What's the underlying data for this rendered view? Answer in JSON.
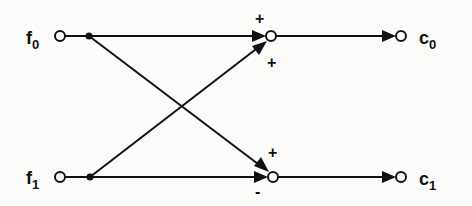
{
  "diagram": {
    "type": "butterfly signal-flow graph",
    "inputs": [
      {
        "id": "f0",
        "label": "f",
        "subscript": "0"
      },
      {
        "id": "f1",
        "label": "f",
        "subscript": "1"
      }
    ],
    "outputs": [
      {
        "id": "c0",
        "label": "c",
        "subscript": "0"
      },
      {
        "id": "c1",
        "label": "c",
        "subscript": "1"
      }
    ],
    "summing_nodes": [
      {
        "id": "sum0",
        "output": "c0",
        "signs": {
          "from_f0": "+",
          "from_f1": "+"
        }
      },
      {
        "id": "sum1",
        "output": "c1",
        "signs": {
          "from_f0": "+",
          "from_f1": "-"
        }
      }
    ],
    "edges": [
      {
        "from": "f0",
        "to": "sum0",
        "sign": "+"
      },
      {
        "from": "f0",
        "to": "sum1",
        "sign": "+"
      },
      {
        "from": "f1",
        "to": "sum0",
        "sign": "+"
      },
      {
        "from": "f1",
        "to": "sum1",
        "sign": "-"
      },
      {
        "from": "sum0",
        "to": "c0"
      },
      {
        "from": "sum1",
        "to": "c1"
      }
    ]
  }
}
